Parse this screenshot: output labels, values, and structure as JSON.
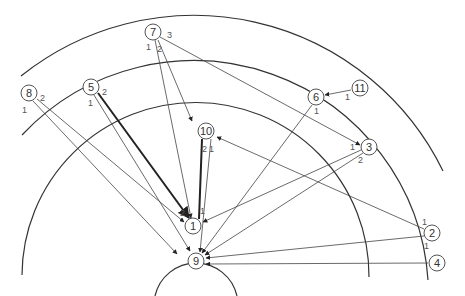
{
  "diagram": {
    "center": [
      196,
      292
    ],
    "arcs": [
      {
        "id": "ring-1",
        "r": 42,
        "start": [
          155,
          296
        ],
        "end": [
          237,
          296
        ]
      },
      {
        "id": "ring-2",
        "r": 171,
        "start": [
          22,
          275
        ],
        "end": [
          369,
          277
        ]
      },
      {
        "id": "ring-3",
        "r": 235,
        "start": [
          22,
          135
        ],
        "end": [
          428,
          280
        ]
      },
      {
        "id": "ring-4",
        "r": 277,
        "start": [
          21,
          76
        ],
        "end": [
          443,
          171
        ]
      }
    ],
    "nodes": [
      {
        "id": "1",
        "label": "1",
        "x": 193,
        "y": 226
      },
      {
        "id": "2",
        "label": "2",
        "x": 432,
        "y": 233
      },
      {
        "id": "3",
        "label": "3",
        "x": 369,
        "y": 147
      },
      {
        "id": "4",
        "label": "4",
        "x": 437,
        "y": 263
      },
      {
        "id": "5",
        "label": "5",
        "x": 91,
        "y": 87
      },
      {
        "id": "6",
        "label": "6",
        "x": 316,
        "y": 97
      },
      {
        "id": "7",
        "label": "7",
        "x": 153,
        "y": 32
      },
      {
        "id": "8",
        "label": "8",
        "x": 29,
        "y": 93
      },
      {
        "id": "9",
        "label": "9",
        "x": 196,
        "y": 261
      },
      {
        "id": "10",
        "label": "10",
        "x": 206,
        "y": 131
      },
      {
        "id": "11",
        "label": "11",
        "x": 360,
        "y": 88
      }
    ],
    "edges": [
      {
        "from": "8",
        "port": "1",
        "x1": 33,
        "y1": 101,
        "x2": 177,
        "y2": 254,
        "arrow": true,
        "thick": false
      },
      {
        "from": "8",
        "port": "2",
        "x1": 37,
        "y1": 99,
        "x2": 184,
        "y2": 222,
        "arrow": true,
        "thick": false
      },
      {
        "from": "5",
        "port": "1",
        "x1": 94,
        "y1": 95,
        "x2": 190,
        "y2": 251,
        "arrow": true,
        "thick": false
      },
      {
        "from": "5",
        "port": "2",
        "x1": 98,
        "y1": 93,
        "x2": 189,
        "y2": 218,
        "arrow": true,
        "thick": true
      },
      {
        "from": "7",
        "port": "1",
        "x1": 155,
        "y1": 40,
        "x2": 191,
        "y2": 218,
        "arrow": true,
        "thick": false
      },
      {
        "from": "7",
        "port": "2",
        "x1": 158,
        "y1": 40,
        "x2": 192,
        "y2": 121,
        "arrow": true,
        "thick": false
      },
      {
        "from": "7",
        "port": "3",
        "x1": 160,
        "y1": 37,
        "x2": 360,
        "y2": 145,
        "arrow": true,
        "thick": false
      },
      {
        "from": "10",
        "port": "2",
        "x1": 202,
        "y1": 139,
        "x2": 199,
        "y2": 219,
        "arrow": false,
        "thick": true
      },
      {
        "from": "10",
        "port": "1",
        "x1": 211,
        "y1": 139,
        "x2": 200,
        "y2": 252,
        "arrow": true,
        "thick": false
      },
      {
        "from": "6",
        "port": "1",
        "x1": 312,
        "y1": 105,
        "x2": 202,
        "y2": 253,
        "arrow": true,
        "thick": false
      },
      {
        "from": "11",
        "port": "1",
        "x1": 351,
        "y1": 90,
        "x2": 325,
        "y2": 95,
        "arrow": true,
        "thick": false
      },
      {
        "from": "3",
        "port": "1",
        "x1": 361,
        "y1": 150,
        "x2": 203,
        "y2": 222,
        "arrow": true,
        "thick": false
      },
      {
        "from": "3",
        "port": "2",
        "x1": 363,
        "y1": 153,
        "x2": 205,
        "y2": 255,
        "arrow": true,
        "thick": false
      },
      {
        "from": "2",
        "port": "1",
        "x1": 424,
        "y1": 229,
        "x2": 217,
        "y2": 137,
        "arrow": true,
        "thick": false
      },
      {
        "from": "2",
        "port": "1b",
        "x1": 424,
        "y1": 236,
        "x2": 206,
        "y2": 258,
        "arrow": true,
        "thick": false
      },
      {
        "from": "4",
        "port": "1",
        "x1": 428,
        "y1": 263,
        "x2": 206,
        "y2": 264,
        "arrow": true,
        "thick": false
      }
    ],
    "port_labels": [
      {
        "text": "1",
        "x": 22,
        "y": 113
      },
      {
        "text": "2",
        "x": 40,
        "y": 101
      },
      {
        "text": "1",
        "x": 88,
        "y": 106
      },
      {
        "text": "2",
        "x": 102,
        "y": 95
      },
      {
        "text": "1",
        "x": 146,
        "y": 50
      },
      {
        "text": "2",
        "x": 157,
        "y": 52
      },
      {
        "text": "3",
        "x": 167,
        "y": 38
      },
      {
        "text": "2",
        "x": 202,
        "y": 152
      },
      {
        "text": "1",
        "x": 209,
        "y": 152
      },
      {
        "text": "1",
        "x": 314,
        "y": 114
      },
      {
        "text": "1",
        "x": 345,
        "y": 100
      },
      {
        "text": "1",
        "x": 350,
        "y": 150
      },
      {
        "text": "2",
        "x": 358,
        "y": 163
      },
      {
        "text": "1",
        "x": 422,
        "y": 225
      },
      {
        "text": "1",
        "x": 424,
        "y": 249
      },
      {
        "text": "2",
        "x": 180,
        "y": 216
      },
      {
        "text": "1",
        "x": 200,
        "y": 214
      }
    ]
  }
}
